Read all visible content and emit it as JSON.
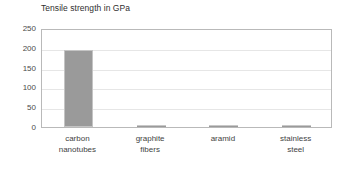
{
  "chart_data": {
    "type": "bar",
    "title": "Tensile strength in GPa",
    "xlabel": "",
    "ylabel": "",
    "categories": [
      "carbon\nnanotubes",
      "graphite\nfibers",
      "aramid",
      "stainless\nsteel"
    ],
    "values": [
      195,
      5,
      4,
      2
    ],
    "ylim": [
      0,
      250
    ],
    "yticks": [
      0,
      50,
      100,
      150,
      200,
      250
    ],
    "ytick_labels": [
      "0",
      "50",
      "100",
      "150",
      "200",
      "250"
    ],
    "grid": true,
    "legend": false,
    "bar_color": "#9a9a9a",
    "bar_border_color": "#c4c4c4",
    "plot_border_color": "#b9b9b9",
    "gridline_color": "#e6e6e6",
    "background_color": "#ffffff"
  }
}
